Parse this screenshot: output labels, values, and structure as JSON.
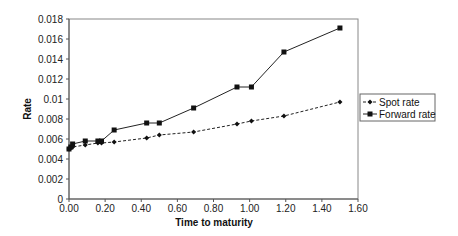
{
  "chart_data": {
    "type": "line",
    "title": "",
    "xlabel": "Time to maturity",
    "ylabel": "Rate",
    "xlim": [
      0,
      1.6
    ],
    "ylim": [
      0,
      0.018
    ],
    "x_ticks": [
      "0.00",
      "0.20",
      "0.40",
      "0.60",
      "0.80",
      "1.00",
      "1.20",
      "1.40",
      "1.60"
    ],
    "y_ticks": [
      "0",
      "0.002",
      "0.004",
      "0.006",
      "0.008",
      "0.01",
      "0.012",
      "0.014",
      "0.016",
      "0.018"
    ],
    "grid": false,
    "legend_position": "right",
    "series": [
      {
        "name": "Spot rate",
        "marker": "diamond",
        "line": "dashed",
        "points": [
          [
            0.0,
            0.005
          ],
          [
            0.01,
            0.0051
          ],
          [
            0.02,
            0.0052
          ],
          [
            0.09,
            0.0054
          ],
          [
            0.16,
            0.0056
          ],
          [
            0.18,
            0.0056
          ],
          [
            0.25,
            0.0057
          ],
          [
            0.43,
            0.0061
          ],
          [
            0.5,
            0.0064
          ],
          [
            0.69,
            0.0067
          ],
          [
            0.93,
            0.0075
          ],
          [
            1.01,
            0.0078
          ],
          [
            1.19,
            0.0083
          ],
          [
            1.5,
            0.0097
          ]
        ]
      },
      {
        "name": "Forward rate",
        "marker": "square",
        "line": "solid",
        "points": [
          [
            0.0,
            0.005
          ],
          [
            0.01,
            0.0052
          ],
          [
            0.02,
            0.0055
          ],
          [
            0.09,
            0.0058
          ],
          [
            0.16,
            0.0058
          ],
          [
            0.18,
            0.0058
          ],
          [
            0.25,
            0.0069
          ],
          [
            0.43,
            0.0076
          ],
          [
            0.5,
            0.0076
          ],
          [
            0.69,
            0.0091
          ],
          [
            0.93,
            0.0112
          ],
          [
            1.01,
            0.0112
          ],
          [
            1.19,
            0.0147
          ],
          [
            1.5,
            0.0171
          ]
        ]
      }
    ]
  },
  "colors": {
    "axis": "#888888",
    "line": "#222222",
    "marker": "#111111"
  }
}
